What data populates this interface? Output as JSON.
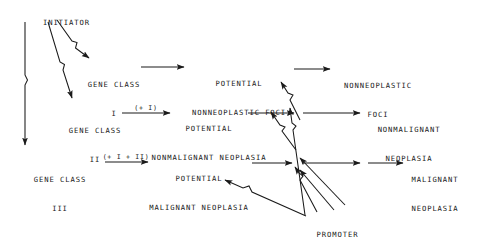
{
  "diagram": {
    "stroke_color": "#1a1a1a",
    "background_color": "#ffffff",
    "nodes": {
      "initiator": {
        "label": "INITIATOR"
      },
      "gene_class_i": {
        "line1": "GENE CLASS",
        "line2": "I"
      },
      "gene_class_ii": {
        "line1": "GENE CLASS",
        "line2": "II"
      },
      "gene_class_iii": {
        "line1": "GENE CLASS",
        "line2": "III"
      },
      "potential_nonneoplastic_foci": {
        "line1": "POTENTIAL",
        "line2": "NONNEOPLASTIC FOCI"
      },
      "potential_nonmalignant_neoplasia": {
        "line1": "POTENTIAL",
        "line2": "NONMALIGNANT NEOPLASIA"
      },
      "potential_malignant_neoplasia": {
        "line1": "POTENTIAL",
        "line2": "MALIGNANT NEOPLASIA"
      },
      "nonneoplastic_foci": {
        "line1": "NONNEOPLASTIC",
        "line2": "FOCI"
      },
      "nonmalignant_neoplasia": {
        "line1": "NONMALIGNANT",
        "line2": "NEOPLASIA"
      },
      "malignant_neoplasia": {
        "line1": "MALIGNANT",
        "line2": "NEOPLASIA"
      },
      "promoter": {
        "label": "PROMOTER"
      }
    },
    "edge_labels": {
      "gene_class_ii_modifier": "(+ I)",
      "gene_class_iii_modifier": "(+ I + II)"
    }
  }
}
